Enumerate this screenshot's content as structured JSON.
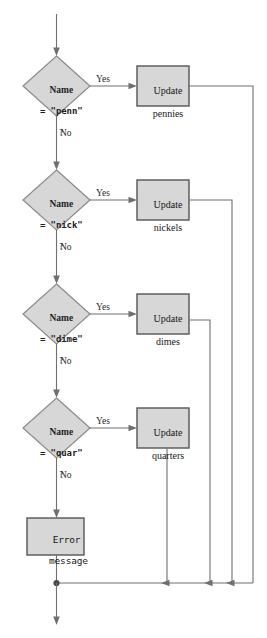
{
  "diagram": {
    "type": "flowchart",
    "colors": {
      "node_fill": "#d7d7d7",
      "diamond_border": "#8a8a8a",
      "process_border": "#555555",
      "edge": "#6f6f6f",
      "text": "#1d1d1d",
      "background": "#ffffff"
    },
    "decisions": [
      {
        "id": "penn",
        "line1": "Name",
        "line2_prefix": "= \"",
        "line2_value": "penn",
        "line2_suffix": "\"",
        "line3": "?",
        "yes_label": "Yes",
        "no_label": "No"
      },
      {
        "id": "nick",
        "line1": "Name",
        "line2_prefix": "= \"",
        "line2_value": "nick",
        "line2_suffix": "\"",
        "line3": "?",
        "yes_label": "Yes",
        "no_label": "No"
      },
      {
        "id": "dime",
        "line1": "Name",
        "line2_prefix": "= \"",
        "line2_value": "dime",
        "line2_suffix": "\"",
        "line3": "?",
        "yes_label": "Yes",
        "no_label": "No"
      },
      {
        "id": "quar",
        "line1": "Name",
        "line2_prefix": "= \"",
        "line2_value": "quar",
        "line2_suffix": "\"",
        "line3": "?",
        "yes_label": "Yes",
        "no_label": "No"
      }
    ],
    "processes": [
      {
        "id": "pennies",
        "line1": "Update",
        "line2": "pennies"
      },
      {
        "id": "nickels",
        "line1": "Update",
        "line2": "nickels"
      },
      {
        "id": "dimes",
        "line1": "Update",
        "line2": "dimes"
      },
      {
        "id": "quarters",
        "line1": "Update",
        "line2": "quarters"
      }
    ],
    "error_box": {
      "id": "error",
      "line1": "Error",
      "line2": "message"
    }
  }
}
